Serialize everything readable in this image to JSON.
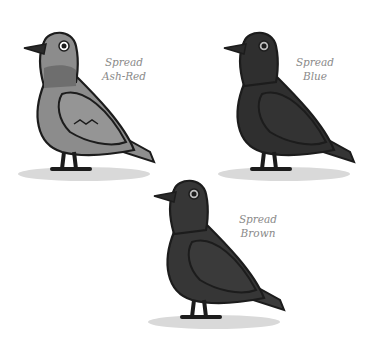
{
  "pigeons": [
    {
      "name": "spread-ash-red",
      "line1": "Spread",
      "line2": "Ash-Red",
      "body": "#8c8c8c",
      "neck": "#6e6e6e",
      "wing": "#959595",
      "tail": "#8e8e8e"
    },
    {
      "name": "spread-blue",
      "line1": "Spread",
      "line2": "Blue",
      "body": "#2f2f2f",
      "neck": "#2a2a2a",
      "wing": "#333333",
      "tail": "#353535"
    },
    {
      "name": "spread-brown",
      "line1": "Spread",
      "line2": "Brown",
      "body": "#363636",
      "neck": "#303030",
      "wing": "#3a3a3a",
      "tail": "#3b3b3b"
    }
  ],
  "colors": {
    "outline": "#1c1c1c",
    "shadow": "#d9d9d9",
    "label": "#8a8a8a",
    "background": "#ffffff"
  }
}
